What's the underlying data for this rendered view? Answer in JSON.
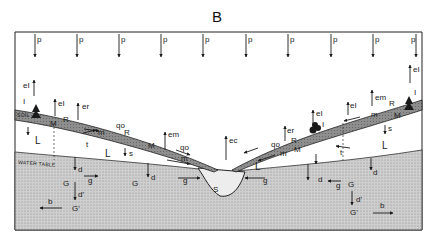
{
  "figure": {
    "panel_label": "B",
    "colors": {
      "background": "#ffffff",
      "ink": "#1a1a1a",
      "soil": "#8c8c8c",
      "groundwater": "#c4c4c4",
      "stream": "#e8e8e8"
    }
  },
  "precipitation": {
    "label": "p",
    "count": 10
  },
  "zones": {
    "soil_label": "SOIL",
    "water_table_label": "WATER TABLE",
    "unsaturated_label": "L",
    "groundwater_label": "G",
    "deep_groundwater_label": "G'",
    "stream_label": "S"
  },
  "left_slope": {
    "labels": [
      "eI",
      "I",
      "I",
      "eI",
      "er",
      "R",
      "M",
      "f",
      "s",
      "L",
      "m",
      "qo",
      "R",
      "em",
      "M",
      "f",
      "m",
      "qo",
      "t",
      "t",
      "L",
      "s",
      "d",
      "g",
      "G",
      "d",
      "d'",
      "G'",
      "b",
      "g"
    ]
  },
  "right_slope": {
    "labels": [
      "eI",
      "I",
      "em",
      "R",
      "I",
      "eI",
      "M",
      "f",
      "s",
      "L",
      "m",
      "eI",
      "I",
      "er",
      "I",
      "R",
      "M",
      "f",
      "s",
      "L",
      "t",
      "m",
      "qo",
      "t",
      "d",
      "d",
      "g",
      "G",
      "d'",
      "G'",
      "b",
      "g"
    ]
  },
  "center": {
    "evaporation_label": "ec",
    "stream_label": "S"
  }
}
